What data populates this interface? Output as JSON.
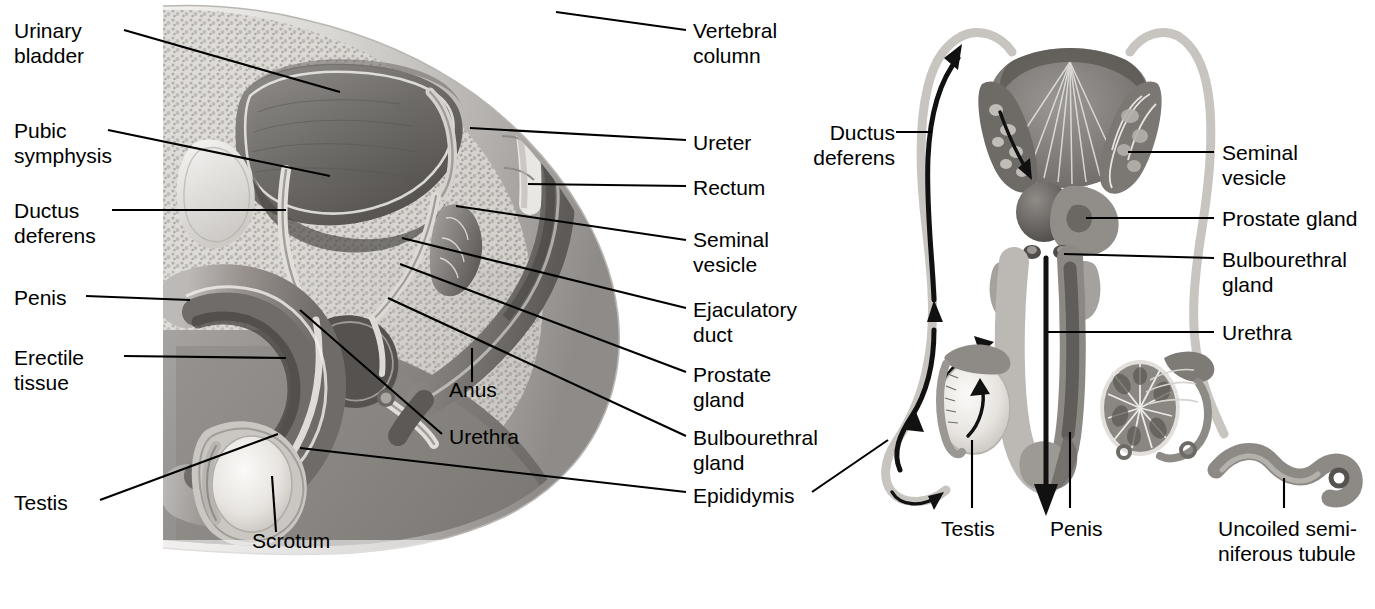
{
  "figure": {
    "panels": [
      {
        "id": "sagittal",
        "name": "Sagittal section of male pelvis"
      },
      {
        "id": "posterior",
        "name": "Posterior view of male reproductive organs and sperm pathway"
      }
    ],
    "ink_color": "#000000",
    "background_color": "#ffffff"
  },
  "left_panel": {
    "labels_left": [
      {
        "text": "Urinary\nbladder",
        "x": 14,
        "y": 18
      },
      {
        "text": "Pubic\nsymphysis",
        "x": 14,
        "y": 118
      },
      {
        "text": "Ductus\ndeferens",
        "x": 14,
        "y": 198
      },
      {
        "text": "Penis",
        "x": 14,
        "y": 285
      },
      {
        "text": "Erectile\ntissue",
        "x": 14,
        "y": 345
      },
      {
        "text": "Testis",
        "x": 14,
        "y": 490
      }
    ],
    "labels_right": [
      {
        "text": "Vertebral\ncolumn",
        "x": 693,
        "y": 18
      },
      {
        "text": "Ureter",
        "x": 693,
        "y": 130
      },
      {
        "text": "Rectum",
        "x": 693,
        "y": 175
      },
      {
        "text": "Seminal\nvesicle",
        "x": 693,
        "y": 227
      },
      {
        "text": "Ejaculatory\nduct",
        "x": 693,
        "y": 297
      },
      {
        "text": "Prostate\ngland",
        "x": 693,
        "y": 362
      },
      {
        "text": "Bulbourethral\ngland",
        "x": 693,
        "y": 425
      },
      {
        "text": "Epididymis",
        "x": 693,
        "y": 483
      }
    ],
    "labels_inner": [
      {
        "text": "Anus",
        "x": 449,
        "y": 388
      },
      {
        "text": "Urethra",
        "x": 449,
        "y": 435
      },
      {
        "text": "Scrotum",
        "x": 252,
        "y": 538
      }
    ]
  },
  "right_panel": {
    "labels_left": [
      {
        "text": "Ductus\ndeferens",
        "x": 795,
        "y": 120
      }
    ],
    "labels_right": [
      {
        "text": "Seminal\nvesicle",
        "x": 1222,
        "y": 140
      },
      {
        "text": "Prostate gland",
        "x": 1222,
        "y": 208
      },
      {
        "text": "Bulbourethral\ngland",
        "x": 1222,
        "y": 249
      },
      {
        "text": "Urethra",
        "x": 1222,
        "y": 322
      }
    ],
    "labels_bottom": [
      {
        "text": "Testis",
        "x": 941,
        "y": 522
      },
      {
        "text": "Penis",
        "x": 1050,
        "y": 522
      },
      {
        "text": "Uncoiled semi-\nniferous tubule",
        "x": 1218,
        "y": 522
      }
    ]
  },
  "structures": {
    "sagittal": [
      "urinary bladder",
      "pubic symphysis",
      "ductus deferens",
      "penis",
      "erectile tissue",
      "testis",
      "scrotum",
      "urethra",
      "anus",
      "vertebral column",
      "ureter",
      "rectum",
      "seminal vesicle",
      "ejaculatory duct",
      "prostate gland",
      "bulbourethral gland",
      "epididymis"
    ],
    "posterior": [
      "ductus deferens",
      "seminal vesicle",
      "prostate gland",
      "bulbourethral gland",
      "urethra",
      "testis",
      "penis",
      "uncoiled seminiferous tubule",
      "sperm flow arrows"
    ]
  }
}
